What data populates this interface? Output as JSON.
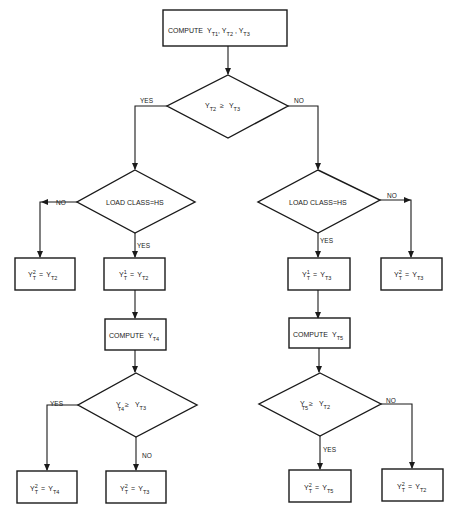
{
  "diagram": {
    "nodes": {
      "start": {
        "prefix": "COMPUTE",
        "vars": [
          "Y",
          "T1",
          "Y",
          "T2",
          "Y",
          "T3"
        ]
      },
      "d1": {
        "lhs": "Y",
        "lhs_sub": "T2",
        "op": "≥",
        "rhs": "Y",
        "rhs_sub": "T3"
      },
      "d2L": {
        "text": "LOAD CLASS=HS"
      },
      "d2R": {
        "text": "LOAD CLASS=HS"
      },
      "bLL": {
        "lhs": "Y",
        "lhs_sup": "2",
        "lhs_sub": "T",
        "eq": "=",
        "rhs": "Y",
        "rhs_sub": "T2"
      },
      "bL": {
        "lhs": "Y",
        "lhs_sup": "1",
        "lhs_sub": "T",
        "eq": "=",
        "rhs": "Y",
        "rhs_sub": "T2"
      },
      "bR": {
        "lhs": "Y",
        "lhs_sup": "1",
        "lhs_sub": "T",
        "eq": "=",
        "rhs": "Y",
        "rhs_sub": "T3"
      },
      "bRR": {
        "lhs": "Y",
        "lhs_sup": "2",
        "lhs_sub": "T",
        "eq": "=",
        "rhs": "Y",
        "rhs_sub": "T3"
      },
      "cL": {
        "prefix": "COMPUTE",
        "var": "Y",
        "sub": "T4"
      },
      "cR": {
        "prefix": "COMPUTE",
        "var": "Y",
        "sub": "T5"
      },
      "d3L": {
        "lhs": "Y",
        "lhs_sub": "T4",
        "op": "≥",
        "rhs": "Y",
        "rhs_sub": "T3"
      },
      "d3R": {
        "lhs": "Y",
        "lhs_sub": "T5",
        "op": "≥",
        "rhs": "Y",
        "rhs_sub": "T2"
      },
      "fLL": {
        "lhs": "Y",
        "lhs_sup": "2",
        "lhs_sub": "T",
        "eq": "=",
        "rhs": "Y",
        "rhs_sub": "T4"
      },
      "fL": {
        "lhs": "Y",
        "lhs_sup": "2",
        "lhs_sub": "T",
        "eq": "=",
        "rhs": "Y",
        "rhs_sub": "T3"
      },
      "fR": {
        "lhs": "Y",
        "lhs_sup": "2",
        "lhs_sub": "T",
        "eq": "=",
        "rhs": "Y",
        "rhs_sub": "T5"
      },
      "fRR": {
        "lhs": "Y",
        "lhs_sup": "2",
        "lhs_sub": "T",
        "eq": "=",
        "rhs": "Y",
        "rhs_sub": "T2"
      }
    },
    "edge_labels": {
      "d1_yes": "YES",
      "d1_no": "NO",
      "d2L_no": "NO",
      "d2L_yes": "YES",
      "d2R_yes": "YES",
      "d2R_no": "NO",
      "d3L_yes": "YES",
      "d3L_no": "NO",
      "d3R_no": "NO",
      "d3R_yes": "YES"
    }
  }
}
